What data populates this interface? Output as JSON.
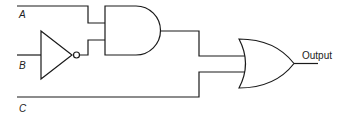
{
  "diagram": {
    "type": "logic-circuit",
    "inputs": [
      {
        "id": "A",
        "label": "A"
      },
      {
        "id": "B",
        "label": "B"
      },
      {
        "id": "C",
        "label": "C"
      }
    ],
    "gates": [
      {
        "id": "not1",
        "type": "NOT",
        "inputs": [
          "B"
        ]
      },
      {
        "id": "and1",
        "type": "AND",
        "inputs": [
          "A",
          "not1"
        ]
      },
      {
        "id": "or1",
        "type": "OR",
        "inputs": [
          "and1",
          "C"
        ]
      }
    ],
    "output": {
      "label": "Output",
      "from": "or1"
    },
    "colors": {
      "line": "#1a1a1a",
      "background": "#ffffff"
    }
  }
}
